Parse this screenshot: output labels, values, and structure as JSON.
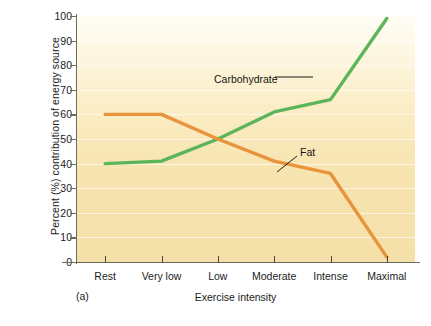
{
  "figure": {
    "panel_label": "(a)",
    "background_color": "#f7e4b0",
    "page_background": "#ffffff"
  },
  "chart_data": {
    "type": "line",
    "title": "",
    "xlabel": "Exercise intensity",
    "ylabel": "Percent (%) contribution of energy source",
    "categories": [
      "Rest",
      "Very low",
      "Low",
      "Moderate",
      "Intense",
      "Maximal"
    ],
    "ylim": [
      0,
      100
    ],
    "yticks": [
      0,
      10,
      20,
      30,
      40,
      50,
      60,
      70,
      80,
      90,
      100
    ],
    "ytick_labels": [
      "0",
      "10",
      "20",
      "30",
      "40",
      "50",
      "60",
      "70",
      "80",
      "90",
      "100"
    ],
    "grid": "horizontal-faint",
    "legend": "inline-annotations",
    "series": [
      {
        "name": "Carbohydrate",
        "color": "#5cb55a",
        "values": [
          40,
          41,
          50,
          61,
          66,
          99
        ],
        "annotation": "Carbohydrate"
      },
      {
        "name": "Fat",
        "color": "#e8943c",
        "values": [
          60,
          60,
          50,
          41,
          36,
          2
        ],
        "annotation": "Fat"
      }
    ]
  },
  "colors": {
    "carbohydrate": "#5cb55a",
    "fat": "#e8943c",
    "axis": "#6e6a5c",
    "text": "#1b1b1b",
    "gridline": "rgba(255,255,255,0.62)"
  }
}
